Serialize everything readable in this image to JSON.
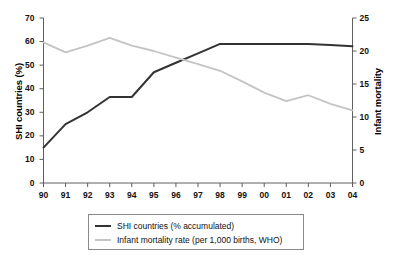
{
  "chart_data": {
    "type": "line",
    "title": "",
    "xlabel": "",
    "ylabel": "SHI countries (%)",
    "y2label": "Infant mortality",
    "grid": false,
    "legend_position": "bottom-center",
    "x": [
      "90",
      "91",
      "92",
      "93",
      "94",
      "95",
      "96",
      "97",
      "98",
      "99",
      "00",
      "01",
      "02",
      "03",
      "04"
    ],
    "xtick_labels": [
      "90",
      "91",
      "92",
      "93",
      "94",
      "95",
      "96",
      "97",
      "98",
      "99",
      "00",
      "01",
      "02",
      "03",
      "04"
    ],
    "ylim": [
      0,
      70
    ],
    "ytick_labels": [
      "0",
      "10",
      "20",
      "30",
      "40",
      "50",
      "60",
      "70"
    ],
    "ytick_values": [
      0,
      10,
      20,
      30,
      40,
      50,
      60,
      70
    ],
    "y2lim": [
      0,
      25
    ],
    "y2tick_labels": [
      "0",
      "5",
      "10",
      "15",
      "20",
      "25"
    ],
    "y2tick_values": [
      0,
      5,
      10,
      15,
      20,
      25
    ],
    "series": [
      {
        "name": "SHI countries (% accumulated)",
        "axis": "left",
        "color": "#333333",
        "width": 2.0,
        "values": [
          15,
          25,
          30,
          36.5,
          36.5,
          47,
          51,
          55,
          59,
          59,
          59,
          59,
          59,
          58.5,
          58
        ]
      },
      {
        "name": "Infant mortality rate (per 1,000 births, WHO)",
        "axis": "right",
        "color": "#c4c4c4",
        "width": 1.8,
        "values": [
          21.3,
          19.8,
          20.8,
          22.0,
          20.8,
          20.0,
          19.0,
          18.0,
          17.0,
          15.4,
          13.7,
          12.4,
          13.3,
          12.0,
          11.0
        ]
      }
    ]
  },
  "legend": {
    "entries": [
      {
        "label": "SHI countries (% accumulated)",
        "color": "#333333"
      },
      {
        "label": "Infant mortality rate (per 1,000 births, WHO)",
        "color": "#c4c4c4"
      }
    ]
  }
}
